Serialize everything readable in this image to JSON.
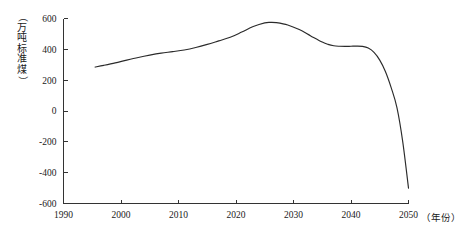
{
  "chart_data": {
    "type": "line",
    "title": "",
    "subtitle": "",
    "xlabel": "年份",
    "ylabel": "万吨标准煤",
    "ylabel_display": "（万吨标准煤）",
    "xlabel_display": "（年份）",
    "xlim": [
      1990,
      2050
    ],
    "ylim": [
      -600,
      600
    ],
    "xticks": [
      1990,
      2000,
      2010,
      2020,
      2030,
      2040,
      2050
    ],
    "xtick_labels": [
      "1990",
      "2000",
      "2010",
      "2020",
      "2030",
      "2040",
      "2050"
    ],
    "yticks": [
      -600,
      -400,
      -200,
      0,
      200,
      400,
      600
    ],
    "ytick_labels": [
      "-600",
      "-400",
      "-200",
      "0",
      "200",
      "400",
      "600"
    ],
    "grid": false,
    "legend": false,
    "legend_position": "none",
    "line_color": "#2b2b2b",
    "axis_color": "#333333",
    "background_color": "#ffffff",
    "series": [
      {
        "name": "万吨标准煤",
        "x": [
          1995.5,
          1997,
          1999,
          2001,
          2003,
          2005,
          2007,
          2009,
          2011,
          2013,
          2015,
          2017,
          2019,
          2021,
          2023,
          2025,
          2026,
          2027,
          2029,
          2031,
          2033,
          2035,
          2036,
          2037,
          2038,
          2039,
          2040,
          2041,
          2042,
          2043,
          2044,
          2045,
          2046,
          2047,
          2048,
          2049,
          2050
        ],
        "values": [
          285,
          296,
          312,
          330,
          347,
          362,
          375,
          385,
          396,
          412,
          432,
          455,
          478,
          512,
          548,
          572,
          575,
          573,
          558,
          528,
          487,
          447,
          432,
          423,
          420,
          419,
          420,
          421,
          419,
          408,
          380,
          330,
          255,
          150,
          20,
          -200,
          -500
        ]
      }
    ],
    "annotations": []
  }
}
